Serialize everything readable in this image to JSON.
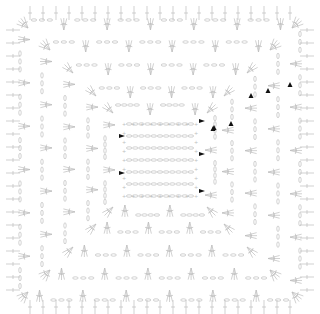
{
  "diagram": {
    "type": "crochet-chart",
    "shape": "granny-square",
    "stitch_color": "#bdbdbd",
    "marker_color": "#111111",
    "rounds": 6,
    "center": [
      160,
      160
    ],
    "round_half_sizes": [
      38,
      55,
      72,
      95,
      118,
      140
    ],
    "triangle_markers": [
      [
        251,
        96
      ],
      [
        268,
        91
      ],
      [
        290,
        85
      ],
      [
        231,
        124
      ],
      [
        213,
        129
      ],
      [
        214,
        128
      ]
    ],
    "start_markers": [
      [
        122,
        136
      ],
      [
        122,
        173
      ],
      [
        202,
        121
      ],
      [
        202,
        154
      ],
      [
        202,
        191
      ]
    ]
  }
}
